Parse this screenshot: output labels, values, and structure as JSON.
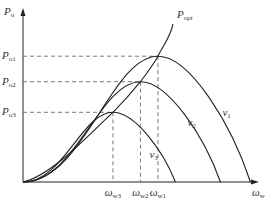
{
  "chart_data": {
    "type": "line",
    "title": "",
    "xlabel": {
      "main": "ω",
      "sub": "w"
    },
    "ylabel": {
      "main": "P",
      "sub": "o"
    },
    "grid": false,
    "series": [
      {
        "name": "v1",
        "label": {
          "main": "v",
          "sub": "1"
        },
        "peak_x": 0.54,
        "peak_y": 0.74,
        "end_x": 0.91
      },
      {
        "name": "v2",
        "label": {
          "main": "v",
          "sub": "2"
        },
        "peak_x": 0.47,
        "peak_y": 0.59,
        "end_x": 0.79
      },
      {
        "name": "v3",
        "label": {
          "main": "v",
          "sub": "3"
        },
        "peak_x": 0.36,
        "peak_y": 0.41,
        "end_x": 0.61
      },
      {
        "name": "Popt",
        "label": {
          "main": "P",
          "sub": "opt"
        },
        "type": "optimal-power-curve",
        "end_x": 0.6,
        "end_y": 0.93
      }
    ],
    "y_ticks": [
      {
        "main": "P",
        "sub": "o1",
        "value": 0.74
      },
      {
        "main": "P",
        "sub": "o2",
        "value": 0.59
      },
      {
        "main": "P",
        "sub": "o3",
        "value": 0.41
      }
    ],
    "x_ticks": [
      {
        "main": "ω",
        "sub": "w3",
        "value": 0.36
      },
      {
        "main": "ω",
        "sub": "w2",
        "value": 0.47
      },
      {
        "main": "ω",
        "sub": "w1",
        "value": 0.54
      }
    ]
  }
}
